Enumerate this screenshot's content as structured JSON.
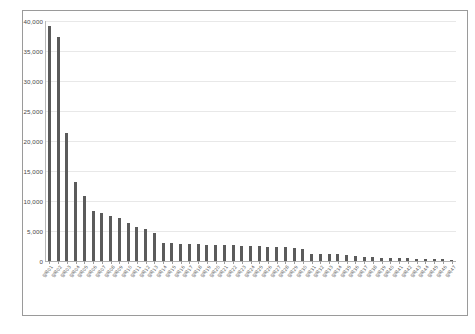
{
  "chart_data": {
    "type": "bar",
    "title": "",
    "subtitle": "",
    "xlabel": "",
    "ylabel": "",
    "ylim": [
      0,
      40000
    ],
    "grid": true,
    "legend": false,
    "legend_position": "none",
    "orientation": "vertical",
    "sorted": "descending",
    "bar_color": "#5b5b5b",
    "gridline_color": "#e8e8e8",
    "axis_color": "#b0b0b0",
    "frame_color": "#9a9a9a",
    "ytick_labels": [
      "0",
      "5,000",
      "10,000",
      "15,000",
      "20,000",
      "25,000",
      "30,000",
      "35,000",
      "40,000"
    ],
    "ytick_values": [
      0,
      5000,
      10000,
      15000,
      20000,
      25000,
      30000,
      35000,
      40000
    ],
    "xtick_labels_legible": false,
    "xtick_labels_note": "rotated CJK (Korean) category labels, illegible at source resolution",
    "categories": [
      "항목01",
      "항목02",
      "항목03",
      "항목04",
      "항목05",
      "항목06",
      "항목07",
      "항목08",
      "항목09",
      "항목10",
      "항목11",
      "항목12",
      "항목13",
      "항목14",
      "항목15",
      "항목16",
      "항목17",
      "항목18",
      "항목19",
      "항목20",
      "항목21",
      "항목22",
      "항목23",
      "항목24",
      "항목25",
      "항목26",
      "항목27",
      "항목28",
      "항목29",
      "항목30",
      "항목31",
      "항목32",
      "항목33",
      "항목34",
      "항목35",
      "항목36",
      "항목37",
      "항목38",
      "항목39",
      "항목40",
      "항목41",
      "항목42",
      "항목43",
      "항목44",
      "항목45",
      "항목46",
      "항목47"
    ],
    "values": [
      39100,
      37400,
      21400,
      13200,
      10800,
      8400,
      8050,
      7450,
      7100,
      6300,
      5650,
      5300,
      4650,
      3050,
      3050,
      2900,
      2850,
      2800,
      2750,
      2700,
      2650,
      2600,
      2550,
      2500,
      2450,
      2400,
      2350,
      2300,
      2250,
      1950,
      1250,
      1250,
      1200,
      1150,
      1050,
      850,
      650,
      600,
      550,
      520,
      480,
      420,
      380,
      330,
      300,
      260,
      230
    ]
  }
}
